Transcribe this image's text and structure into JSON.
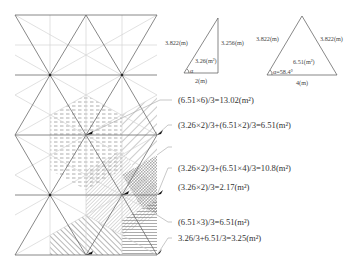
{
  "reference_triangles": {
    "right_triangle": {
      "hypotenuse": "3.822(m)",
      "height": "3.256(m)",
      "base": "2(m)",
      "area": "3.26(m²)",
      "angle": "α"
    },
    "isosceles_triangle": {
      "left_side": "3.822(m)",
      "right_side": "3.822(m)",
      "base": "4(m)",
      "area": "6.51(m²)",
      "angle": "α=58.4°"
    }
  },
  "annotations": [
    {
      "id": "a1",
      "text": "(6.51×6)/3=13.02(m²)",
      "pattern": "dashed"
    },
    {
      "id": "a2",
      "text": "(3.26×2)/3+(6.51×2)/3=6.51(m²)",
      "pattern": "diagonal-wide"
    },
    {
      "id": "a3",
      "text": "(3.26×2)/3+(6.51×4)/3=10.8(m²)",
      "pattern": "diagonal-dense"
    },
    {
      "id": "a4",
      "text": "(3.26×2)/3=2.17(m²)",
      "pattern": "checker"
    },
    {
      "id": "a5",
      "text": "(6.51×3)/3=6.51(m²)",
      "pattern": "diagonal-bold"
    },
    {
      "id": "a6",
      "text": "3.26/3+6.51/3=3.25(m²)",
      "pattern": "horizontal"
    }
  ],
  "colors": {
    "grid_light": "#d4d4d4",
    "grid_dark": "#6a6a6a",
    "hatch": "#8a8a8a",
    "text": "#333333"
  }
}
